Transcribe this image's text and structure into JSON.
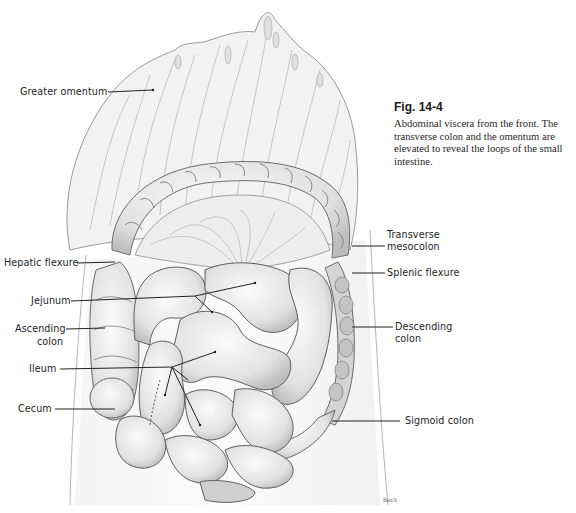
{
  "figure": {
    "number": "Fig. 14-4",
    "caption": "Abdominal viscera from the front. The transverse colon and the omentum are elevated to reveal the loops of the small intestine.",
    "artist_signature": "Beck"
  },
  "labels": {
    "greater_omentum": "Greater omentum",
    "hepatic_flexure": "Hepatic flexure",
    "jejunum": "Jejunum",
    "ascending_colon_1": "Ascending",
    "ascending_colon_2": "colon",
    "ileum": "Ileum",
    "cecum": "Cecum",
    "transverse_mesocolon_1": "Transverse",
    "transverse_mesocolon_2": "mesocolon",
    "splenic_flexure": "Splenic flexure",
    "descending_colon_1": "Descending",
    "descending_colon_2": "colon",
    "sigmoid_colon": "Sigmoid colon"
  },
  "colors": {
    "ink": "#1e1e1e",
    "tissue_light": "#f1f1f1",
    "tissue_mid": "#d9d9d9",
    "tissue_shadow": "#8a8a8a"
  }
}
